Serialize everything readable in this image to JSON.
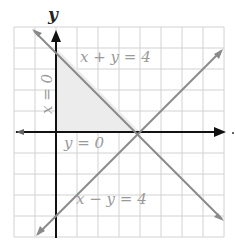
{
  "diagram": {
    "axis_labels": {
      "y": "y",
      "x": "x"
    },
    "equations": {
      "top": "x + y = 4",
      "left": "x = 0",
      "middle": "y = 0",
      "bottom": "x − y = 4"
    },
    "grid": {
      "x_range": [
        -2,
        8
      ],
      "y_range": [
        -5,
        5
      ],
      "unit_px": 21
    },
    "shaded_region": "triangle (0,0),(0,4),(4,0)",
    "colors": {
      "grid": "#d0d0d0",
      "axis": "#111111",
      "line": "#8a8a8a",
      "shade": "#ececec",
      "label": "#9a9a9a"
    }
  }
}
